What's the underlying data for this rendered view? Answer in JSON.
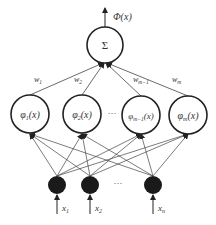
{
  "diagram": {
    "output": {
      "label": "Φ(x)",
      "node_symbol": "Σ"
    },
    "weights": [
      "w",
      "w",
      "w",
      "w"
    ],
    "weight_subscripts": [
      "1",
      "2",
      "m−1",
      "m"
    ],
    "hidden_nodes": [
      {
        "base": "φ",
        "sub": "1",
        "arg": "(x)"
      },
      {
        "base": "φ",
        "sub": "2",
        "arg": "(x)"
      },
      {
        "base": "φ",
        "sub": "m−1",
        "arg": "(x)"
      },
      {
        "base": "φ",
        "sub": "m",
        "arg": "(x)"
      }
    ],
    "hidden_ellipsis": "···",
    "inputs": [
      {
        "base": "x",
        "sub": "1"
      },
      {
        "base": "x",
        "sub": "2"
      },
      {
        "base": "x",
        "sub": "n"
      }
    ],
    "input_ellipsis": "···"
  }
}
